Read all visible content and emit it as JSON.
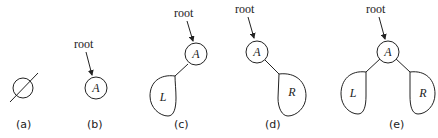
{
  "diagram": {
    "root_label": "root",
    "panels": [
      {
        "id": "a",
        "caption": "(a)",
        "description": "empty tree",
        "symbol": "empty-set"
      },
      {
        "id": "b",
        "caption": "(b)",
        "description": "single root node",
        "root_node": "A"
      },
      {
        "id": "c",
        "caption": "(c)",
        "description": "root with left subtree only",
        "root_node": "A",
        "left": "L"
      },
      {
        "id": "d",
        "caption": "(d)",
        "description": "root with right subtree only",
        "root_node": "A",
        "right": "R"
      },
      {
        "id": "e",
        "caption": "(e)",
        "description": "root with left and right subtrees",
        "root_node": "A",
        "left": "L",
        "right": "R"
      }
    ]
  },
  "colors": {
    "stroke": "#222222",
    "background": "#ffffff"
  }
}
